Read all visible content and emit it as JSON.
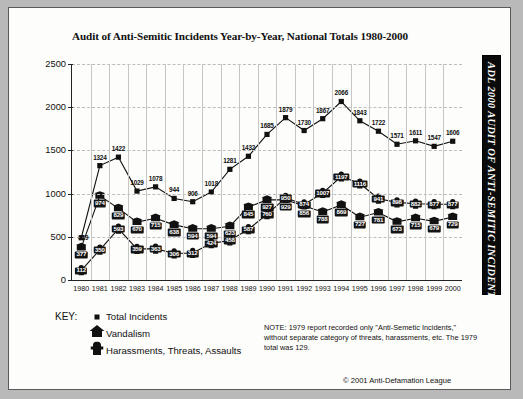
{
  "title": "Audit of Anti-Semitic Incidents Year-by-Year, National Totals 1980-2000",
  "sidebar": {
    "text": "ADL 2000 AUDIT OF ANTI-SEMITIC INCIDENTS"
  },
  "key": {
    "label": "KEY:",
    "items": [
      {
        "name": "total-incidents",
        "label": "Total Incidents",
        "glyph": "square"
      },
      {
        "name": "vandalism",
        "label": "Vandalism",
        "glyph": "house"
      },
      {
        "name": "harassments",
        "label": "Harassments, Threats, Assaults",
        "glyph": "cross"
      }
    ]
  },
  "note": "NOTE: 1979 report recorded only \"Anti-Semetic Incidents,\" without separate category of threats, harassments, etc. The 1979 total was 129.",
  "copyright": "© 2001 Anti-Defamation League",
  "chart_data": {
    "type": "line",
    "title": "Audit of Anti-Semitic Incidents Year-by-Year, National Totals 1980-2000",
    "xlabel": "",
    "ylabel": "",
    "ylim": [
      0,
      2500
    ],
    "yticks": [
      0,
      500,
      1000,
      1500,
      2000,
      2500
    ],
    "grid": true,
    "legend_position": "bottom-left",
    "categories": [
      "1980",
      "1981",
      "1982",
      "1983",
      "1984",
      "1985",
      "1986",
      "1987",
      "1988",
      "1989",
      "1990",
      "1991",
      "1992",
      "1993",
      "1994",
      "1995",
      "1996",
      "1997",
      "1998",
      "1999",
      "2000"
    ],
    "series": [
      {
        "name": "Total Incidents",
        "marker": "square",
        "values": [
          489,
          1324,
          1422,
          1029,
          1078,
          944,
          906,
          1018,
          1281,
          1432,
          1685,
          1879,
          1730,
          1867,
          2066,
          1843,
          1722,
          1571,
          1611,
          1547,
          1606
        ]
      },
      {
        "name": "Vandalism",
        "marker": "house",
        "values": [
          377,
          974,
          829,
          670,
          715,
          638,
          594,
          594,
          623,
          845,
          927,
          929,
          856,
          788,
          869,
          727,
          781,
          673,
          715,
          679,
          729
        ]
      },
      {
        "name": "Harassments, Threats, Assaults",
        "marker": "cross",
        "values": [
          112,
          350,
          593,
          359,
          363,
          306,
          312,
          424,
          458,
          587,
          760,
          950,
          874,
          1007,
          1197,
          1116,
          941,
          898,
          882,
          877,
          877
        ]
      }
    ]
  }
}
